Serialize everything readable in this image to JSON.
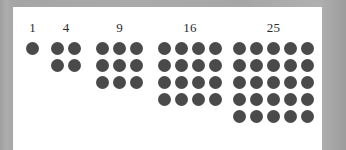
{
  "figure": {
    "kind": "square-numbers-dot-array",
    "background_color": "#a9a9a9",
    "card_color": "#ffffff",
    "dot_color": "#4a4a4a",
    "label_color": "#2b2b2b",
    "groups": [
      {
        "label": "1",
        "side": 1,
        "count": 1,
        "left": 11
      },
      {
        "label": "4",
        "side": 2,
        "count": 4,
        "left": 36
      },
      {
        "label": "9",
        "side": 3,
        "count": 9,
        "left": 81
      },
      {
        "label": "16",
        "side": 4,
        "count": 16,
        "left": 143
      },
      {
        "label": "25",
        "side": 5,
        "count": 25,
        "left": 218
      }
    ]
  },
  "chart_data": {
    "type": "bar",
    "title": "",
    "subtitle": "",
    "xlabel": "",
    "ylabel": "",
    "categories": [
      "1",
      "4",
      "9",
      "16",
      "25"
    ],
    "values": [
      1,
      4,
      9,
      16,
      25
    ],
    "data_labels": [
      "1",
      "4",
      "9",
      "16",
      "25"
    ],
    "grid": false,
    "legend": null,
    "series": [
      {
        "name": "dots",
        "values": [
          1,
          4,
          9,
          16,
          25
        ],
        "side_lengths": [
          1,
          2,
          3,
          4,
          5
        ]
      }
    ]
  }
}
